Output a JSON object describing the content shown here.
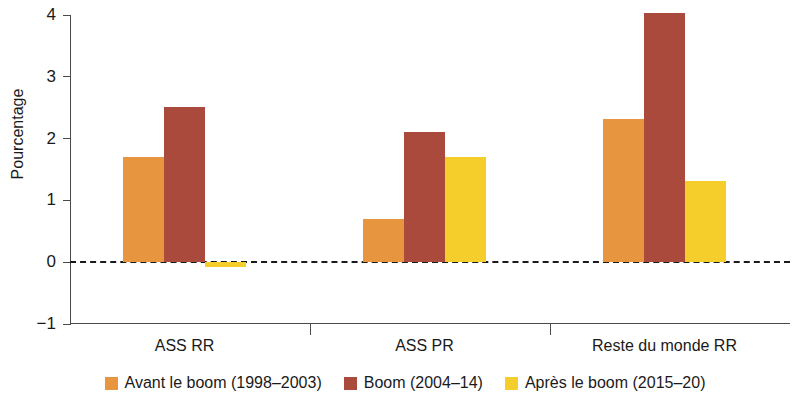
{
  "chart_data": {
    "type": "bar",
    "title": "",
    "xlabel": "",
    "ylabel": "Pourcentage",
    "ylim": [
      -1,
      4
    ],
    "yticks": [
      4,
      3,
      2,
      1,
      0,
      -1
    ],
    "ytick_labels": [
      "4",
      "3",
      "2",
      "1",
      "0",
      "−1"
    ],
    "grid": false,
    "zero_line": true,
    "legend_position": "bottom",
    "categories": [
      "ASS RR",
      "ASS PR",
      "Reste du monde RR"
    ],
    "series": [
      {
        "name": "Avant le boom (1998–2003)",
        "color": "#E8953F",
        "values": [
          1.7,
          0.7,
          2.32
        ]
      },
      {
        "name": "Boom (2004–14)",
        "color": "#A94A3C",
        "values": [
          2.51,
          2.11,
          4.04
        ]
      },
      {
        "name": "Après le boom (2015–20)",
        "color": "#F5CE2B",
        "values": [
          -0.08,
          1.71,
          1.32
        ]
      }
    ]
  },
  "axis": {
    "y_title": "Pourcentage",
    "y_tick_labels": [
      "4",
      "3",
      "2",
      "1",
      "0",
      "−1"
    ]
  },
  "legend": {
    "items": [
      {
        "label": "Avant le boom (1998–2003)",
        "color": "#E8953F"
      },
      {
        "label": "Boom (2004–14)",
        "color": "#A94A3C"
      },
      {
        "label": "Après le boom (2015–20)",
        "color": "#F5CE2B"
      }
    ]
  },
  "categories": [
    "ASS RR",
    "ASS PR",
    "Reste du monde RR"
  ]
}
